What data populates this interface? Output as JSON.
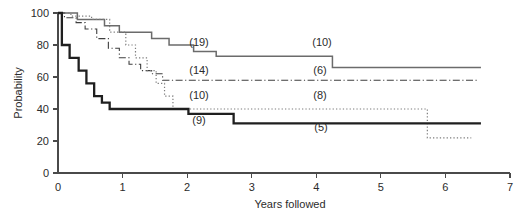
{
  "figure": {
    "width": 526,
    "height": 217,
    "background": "#ffffff"
  },
  "chart_data": {
    "type": "line",
    "subtype": "kaplan-meier-step",
    "title": "",
    "xlabel": "Years followed",
    "ylabel": "Probability",
    "xlim": [
      0,
      7
    ],
    "ylim": [
      0,
      100
    ],
    "xticks": [
      0,
      1,
      2,
      3,
      4,
      5,
      6,
      7
    ],
    "xticklabels": [
      "0",
      "1",
      "2",
      "3",
      "4",
      "5",
      "6",
      "7"
    ],
    "yticks": [
      0,
      20,
      40,
      60,
      80,
      100
    ],
    "yticklabels": [
      "0",
      "20",
      "40",
      "60",
      "80",
      "100"
    ],
    "grid": false,
    "legend": "none",
    "annotations_note": "Parenthesized numbers are numbers at risk placed beside each curve",
    "series": [
      {
        "name": "curve-1",
        "style": "solid-thin",
        "color": "#6b6b6b",
        "at_risk_labels": [
          "(19)",
          "(10)"
        ],
        "x": [
          0.0,
          0.12,
          0.12,
          0.3,
          0.3,
          0.55,
          0.55,
          0.72,
          0.72,
          0.95,
          0.95,
          1.22,
          1.22,
          1.45,
          1.45,
          1.72,
          1.72,
          1.95,
          1.95,
          2.1,
          2.1,
          2.45,
          2.45,
          4.25,
          4.25,
          6.55
        ],
        "y": [
          100,
          100,
          100,
          100,
          96,
          96,
          96,
          96,
          92,
          92,
          88,
          88,
          88,
          88,
          84,
          84,
          80,
          80,
          80,
          80,
          76,
          76,
          73,
          73,
          66,
          66
        ]
      },
      {
        "name": "curve-2",
        "style": "dash-dot",
        "color": "#3f3f3f",
        "at_risk_labels": [
          "(14)",
          "(6)"
        ],
        "x": [
          0.0,
          0.1,
          0.1,
          0.28,
          0.28,
          0.42,
          0.42,
          0.6,
          0.6,
          0.78,
          0.78,
          0.95,
          0.95,
          1.1,
          1.1,
          1.28,
          1.28,
          1.45,
          1.45,
          1.62,
          1.62,
          6.5
        ],
        "y": [
          100,
          100,
          97,
          97,
          94,
          94,
          90,
          90,
          84,
          84,
          78,
          78,
          72,
          72,
          68,
          68,
          64,
          64,
          62,
          62,
          58,
          58
        ]
      },
      {
        "name": "curve-3",
        "style": "dotted",
        "color": "#7d7d7d",
        "at_risk_labels": [
          "(10)",
          "(8)"
        ],
        "x": [
          0.0,
          0.2,
          0.2,
          0.52,
          0.52,
          0.8,
          0.8,
          1.05,
          1.05,
          1.2,
          1.2,
          1.38,
          1.38,
          1.52,
          1.52,
          1.65,
          1.65,
          1.78,
          1.78,
          5.72,
          5.72,
          6.4
        ],
        "y": [
          100,
          100,
          98,
          98,
          96,
          96,
          88,
          88,
          80,
          80,
          72,
          72,
          64,
          64,
          56,
          56,
          48,
          48,
          40,
          40,
          22,
          22
        ]
      },
      {
        "name": "curve-4",
        "style": "solid-thick",
        "color": "#1f1f1f",
        "at_risk_labels": [
          "(9)",
          "(5)"
        ],
        "x": [
          0.0,
          0.06,
          0.06,
          0.18,
          0.18,
          0.32,
          0.32,
          0.44,
          0.44,
          0.56,
          0.56,
          0.68,
          0.68,
          0.8,
          0.8,
          2.02,
          2.02,
          2.72,
          2.72,
          6.55
        ],
        "y": [
          100,
          100,
          80,
          80,
          72,
          72,
          64,
          64,
          56,
          56,
          48,
          48,
          44,
          44,
          40,
          40,
          37,
          37,
          31,
          31
        ]
      }
    ]
  },
  "annotations": [
    {
      "text": "(19)",
      "x_px": 199,
      "y_px": 46
    },
    {
      "text": "(10)",
      "x_px": 322,
      "y_px": 46
    },
    {
      "text": "(14)",
      "x_px": 199,
      "y_px": 74
    },
    {
      "text": "(6)",
      "x_px": 320,
      "y_px": 74
    },
    {
      "text": "(10)",
      "x_px": 199,
      "y_px": 99
    },
    {
      "text": "(8)",
      "x_px": 320,
      "y_px": 99
    },
    {
      "text": "(9)",
      "x_px": 199,
      "y_px": 124
    },
    {
      "text": "(5)",
      "x_px": 321,
      "y_px": 131
    }
  ]
}
